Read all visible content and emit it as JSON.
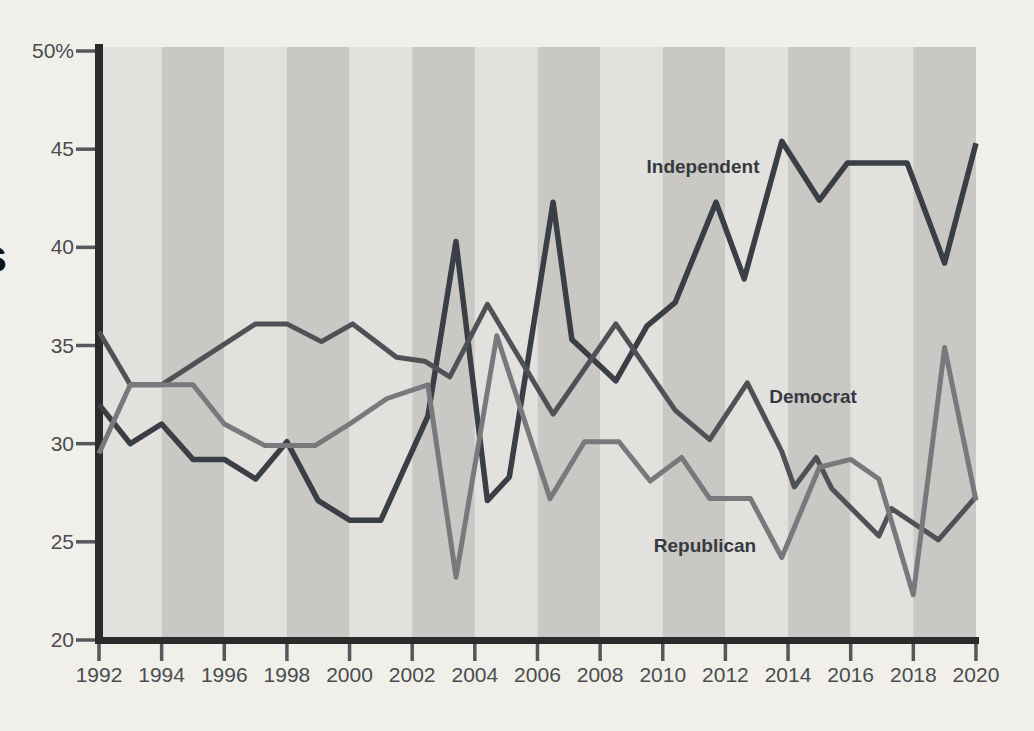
{
  "page": {
    "background_color": "#f0efea"
  },
  "fragments": {
    "left_edge_letter": "s"
  },
  "chart_data": {
    "type": "line",
    "title": "",
    "xlabel": "",
    "ylabel": "",
    "x_range": [
      1992,
      2020
    ],
    "y_range": [
      20,
      50
    ],
    "grid": "off",
    "legend_position": "inline-labels-on-lines",
    "x_tick_labels": [
      "1992",
      "1994",
      "1996",
      "1998",
      "2000",
      "2002",
      "2004",
      "2006",
      "2008",
      "2010",
      "2012",
      "2014",
      "2016",
      "2018",
      "2020"
    ],
    "y_tick_labels": [
      "20",
      "25",
      "30",
      "35",
      "40",
      "45",
      "50%"
    ],
    "axis_color": "#2b2b2b",
    "tick_text_color": "#4a4c4f",
    "series_label_color": "#363a40",
    "background_bands": {
      "start_year": 1992,
      "years_per_band": 2,
      "light_color": "#e2e1de",
      "dark_color": "#c9c8c5",
      "first_band": "light"
    },
    "series": [
      {
        "name": "Independent",
        "color": "#3a3e45",
        "stroke_width": 5.5,
        "points": [
          [
            1992,
            32.0
          ],
          [
            1993,
            30.0
          ],
          [
            1994,
            31.0
          ],
          [
            1995,
            29.2
          ],
          [
            1996,
            29.2
          ],
          [
            1997,
            28.2
          ],
          [
            1998,
            30.1
          ],
          [
            1999,
            27.1
          ],
          [
            2000,
            26.1
          ],
          [
            2001,
            26.1
          ],
          [
            2002.5,
            31.4
          ],
          [
            2003.4,
            40.3
          ],
          [
            2004.4,
            27.1
          ],
          [
            2005.1,
            28.3
          ],
          [
            2006.5,
            42.3
          ],
          [
            2007.1,
            35.3
          ],
          [
            2008.5,
            33.2
          ],
          [
            2009.5,
            36.0
          ],
          [
            2010.4,
            37.2
          ],
          [
            2011.7,
            42.3
          ],
          [
            2012.6,
            38.4
          ],
          [
            2013.8,
            45.4
          ],
          [
            2015.0,
            42.4
          ],
          [
            2015.9,
            44.3
          ],
          [
            2017.8,
            44.3
          ],
          [
            2019.0,
            39.2
          ],
          [
            2020,
            45.3
          ]
        ]
      },
      {
        "name": "Democrat",
        "color": "#4e5257",
        "stroke_width": 5,
        "points": [
          [
            1992,
            35.7
          ],
          [
            1993,
            33.0
          ],
          [
            1994,
            33.0
          ],
          [
            1997,
            36.1
          ],
          [
            1998,
            36.1
          ],
          [
            1999.1,
            35.2
          ],
          [
            2000.1,
            36.1
          ],
          [
            2001.5,
            34.4
          ],
          [
            2002.4,
            34.2
          ],
          [
            2003.2,
            33.4
          ],
          [
            2004.4,
            37.1
          ],
          [
            2006.5,
            31.5
          ],
          [
            2008.5,
            36.1
          ],
          [
            2010.4,
            31.7
          ],
          [
            2011.5,
            30.2
          ],
          [
            2012.7,
            33.1
          ],
          [
            2013.8,
            29.6
          ],
          [
            2014.2,
            27.8
          ],
          [
            2014.9,
            29.3
          ],
          [
            2015.4,
            27.7
          ],
          [
            2016.9,
            25.3
          ],
          [
            2017.3,
            26.7
          ],
          [
            2018.8,
            25.1
          ],
          [
            2020,
            27.3
          ]
        ]
      },
      {
        "name": "Republican",
        "color": "#77797c",
        "stroke_width": 5,
        "points": [
          [
            1992,
            29.5
          ],
          [
            1993,
            33.0
          ],
          [
            1995,
            33.0
          ],
          [
            1996,
            31.0
          ],
          [
            1997.3,
            29.9
          ],
          [
            1998.9,
            29.9
          ],
          [
            2000,
            31.0
          ],
          [
            2001.2,
            32.3
          ],
          [
            2002.5,
            33.0
          ],
          [
            2003.4,
            23.2
          ],
          [
            2004.7,
            35.5
          ],
          [
            2006.4,
            27.2
          ],
          [
            2007.5,
            30.1
          ],
          [
            2008.6,
            30.1
          ],
          [
            2009.6,
            28.1
          ],
          [
            2010.6,
            29.3
          ],
          [
            2011.5,
            27.2
          ],
          [
            2012.8,
            27.2
          ],
          [
            2013.8,
            24.2
          ],
          [
            2015.0,
            28.8
          ],
          [
            2016.0,
            29.2
          ],
          [
            2016.9,
            28.2
          ],
          [
            2018.0,
            22.3
          ],
          [
            2019.0,
            34.9
          ],
          [
            2020,
            27.1
          ]
        ]
      }
    ]
  }
}
